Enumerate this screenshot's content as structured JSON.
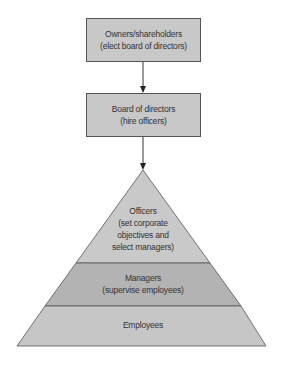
{
  "diagram": {
    "boxes": [
      {
        "title": "Owners/shareholders",
        "subtitle": "(elect board of directors)"
      },
      {
        "title": "Board of directors",
        "subtitle": "(hire officers)"
      }
    ],
    "pyramid": {
      "officers": {
        "line1": "Officers",
        "line2": "(set corporate",
        "line3": "objectives and",
        "line4": "select managers)"
      },
      "managers": {
        "line1": "Managers",
        "line2": "(supervise employees)"
      },
      "employees": {
        "line1": "Employees"
      }
    },
    "colors": {
      "box_fill": "#c8c8c8",
      "officers_fill": "#c9c9c9",
      "managers_fill": "#b3b3b3",
      "employees_fill": "#c6c6c6",
      "stroke": "#555555"
    }
  }
}
